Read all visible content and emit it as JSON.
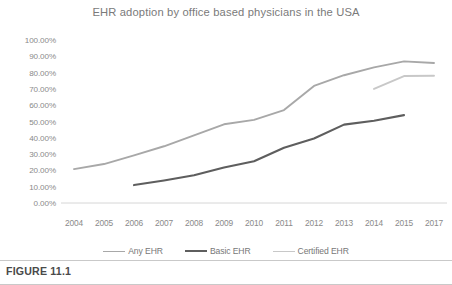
{
  "figure": {
    "caption": "FIGURE 11.1"
  },
  "chart_data": {
    "type": "line",
    "title": "EHR adoption by office based physicians in the USA",
    "xlabel": "",
    "ylabel": "",
    "categories": [
      "2004",
      "2005",
      "2006",
      "2007",
      "2008",
      "2009",
      "2010",
      "2011",
      "2012",
      "2013",
      "2014",
      "2015",
      "2017"
    ],
    "x": [
      2004,
      2005,
      2006,
      2007,
      2008,
      2009,
      2010,
      2011,
      2012,
      2013,
      2014,
      2015,
      2017
    ],
    "ylim": [
      0,
      100
    ],
    "yticks": [
      0,
      10,
      20,
      30,
      40,
      50,
      60,
      70,
      80,
      90,
      100
    ],
    "ytick_labels": [
      "0.00%",
      "10.00%",
      "20.00%",
      "30.00%",
      "40.00%",
      "50.00%",
      "60.00%",
      "70.00%",
      "80.00%",
      "90.00%",
      "100.00%"
    ],
    "ytick_format": "percent",
    "grid": false,
    "legend_position": "bottom",
    "series": [
      {
        "name": "Any EHR",
        "color": "#a8a8a8",
        "width": 1.9,
        "values": [
          20.8,
          23.9,
          29.2,
          34.8,
          41.5,
          48.3,
          51.0,
          57.0,
          71.8,
          78.4,
          83.2,
          86.9,
          85.9
        ]
      },
      {
        "name": "Basic EHR",
        "color": "#5e5e5e",
        "width": 2.1,
        "values": [
          null,
          null,
          11.0,
          13.8,
          17.0,
          21.8,
          25.6,
          33.9,
          39.6,
          48.1,
          50.5,
          53.9,
          null
        ]
      },
      {
        "name": "Certified EHR",
        "color": "#c8c8c8",
        "width": 1.9,
        "values": [
          null,
          null,
          null,
          null,
          null,
          null,
          null,
          null,
          null,
          null,
          70.0,
          77.9,
          78.1
        ]
      }
    ]
  },
  "colors": {
    "any_ehr": "#a8a8a8",
    "basic_ehr": "#5e5e5e",
    "certified_ehr": "#c8c8c8",
    "axis": "#d6d6d6",
    "text": "#8a8a8a",
    "caption_rule": "#c9c9c9"
  }
}
